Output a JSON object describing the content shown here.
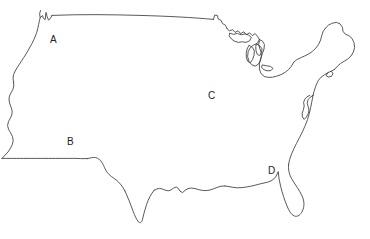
{
  "figure": {
    "kind": "map-outline",
    "width": 370,
    "height": 239,
    "background_color": "#ffffff",
    "outline_color": "#3b3b3b",
    "outline_width": 0.85,
    "label_color": "#1d1d1d",
    "label_font_size": 10
  },
  "labels": [
    {
      "id": "label-a",
      "text": "A",
      "x": 50,
      "y": 35,
      "region_hint": "Pacific Northwest"
    },
    {
      "id": "label-b",
      "text": "B",
      "x": 67,
      "y": 137,
      "region_hint": "Southwest"
    },
    {
      "id": "label-c",
      "text": "C",
      "x": 208,
      "y": 91,
      "region_hint": "Midwest"
    },
    {
      "id": "label-d",
      "text": "D",
      "x": 268,
      "y": 166,
      "region_hint": "Southeast Gulf"
    }
  ],
  "outline": {
    "description": "Contiguous United States coastline and national borders, single continuous stroke plus Great Lakes interior lines",
    "main_path": "M 41 11 L 40 18 L 43 16 L 45 19 L 46 12 L 48 20 L 51 18 L 54 16 L 62 15 L 75 14 L 92 14 L 112 15 L 134 16 L 158 17 L 176 18 L 192 19 L 205 20 L 214 21 L 216 16 L 219 17 L 221 22 L 224 26 L 227 31 L 230 33 L 233 31 L 236 34 L 240 32 L 243 35 L 246 33 L 249 36 L 252 34 L 255 37 L 258 40 L 256 44 L 252 46 L 249 50 L 247 55 L 249 59 L 252 57 L 254 52 L 257 48 L 259 44 L 262 41 L 264 44 L 262 49 L 259 54 L 256 60 L 254 66 L 252 73 L 251 80 L 253 86 L 257 89 L 261 88 L 264 85 L 266 81 L 269 78 L 272 76 L 276 75 L 280 74 L 284 73 L 288 71 L 292 69 L 295 66 L 297 62 L 300 59 L 304 57 L 308 55 L 312 53 L 316 50 L 319 46 L 322 42 L 324 37 L 326 32 L 328 27 L 331 24 L 334 22 L 337 21 L 340 23 L 342 27 L 345 30 L 348 32 L 351 35 L 353 39 L 355 44 L 356 50 L 354 55 L 351 59 L 348 62 L 345 65 L 343 69 L 341 73 L 338 76 L 334 78 L 331 81 L 328 84 L 325 87 L 322 90 L 319 93 L 317 97 L 315 101 L 313 105 L 311 109 L 310 113 L 309 117 L 308 121 L 306 125 L 304 129 L 302 133 L 300 137 L 298 141 L 296 145 L 294 149 L 292 153 L 290 157 L 288 161 L 287 165 L 287 169 L 288 173 L 290 177 L 293 181 L 296 185 L 299 189 L 301 193 L 303 197 L 304 201 L 304 205 L 303 209 L 301 213 L 298 216 L 295 218 L 292 217 L 289 214 L 287 210 L 285 206 L 283 202 L 281 198 L 280 194 L 279 190 L 278 186 L 277 182 L 276 178 L 274 181 L 271 183 L 268 184 L 264 185 L 260 186 L 256 187 L 252 188 L 248 189 L 244 190 L 240 191 L 236 192 L 232 192 L 228 192 L 224 191 L 220 191 L 216 190 L 212 190 L 208 191 L 204 192 L 200 193 L 196 194 L 192 195 L 188 196 L 184 197 L 180 198 L 176 198 L 172 197 L 168 196 L 164 195 L 160 196 L 157 199 L 155 203 L 153 207 L 151 211 L 149 215 L 147 219 L 144 221 L 141 219 L 139 215 L 137 211 L 135 207 L 133 203 L 131 199 L 129 195 L 127 191 L 125 187 L 123 183 L 121 180 L 118 178 L 115 177 L 112 176 L 109 175 L 106 174 L 103 173 L 100 172 L 97 172 L 94 172 L 91 172 L 88 172 L 85 172 L 82 172 L 79 172 L 76 172 L 73 172 L 70 172 L 67 172 L 64 172 L 61 172 L 58 172 L 55 172 L 52 172 L 49 172 L 46 172 L 43 172 L 40 172 L 37 172 L 34 172 L 31 172 L 28 172 L 25 172 L 22 172 L 19 172 L 16 172 L 13 172 L 10 172 L 8 170 L 7 166 L 8 162 L 9 158 L 10 154 L 11 150 L 11 146 L 10 142 L 9 138 L 9 134 L 10 130 L 11 126 L 12 122 L 12 118 L 11 114 L 10 110 L 10 106 L 11 102 L 12 98 L 13 94 L 14 90 L 14 86 L 13 82 L 13 78 L 14 74 L 16 70 L 18 66 L 20 62 L 22 58 L 24 54 L 26 50 L 28 46 L 30 42 L 32 38 L 34 34 L 36 30 L 37 26 L 38 22 L 39 18 Z",
    "great_lakes": [
      "M 232 33 L 236 35 L 240 34 L 244 36 L 248 35 L 252 37 L 250 41 L 246 43 L 242 42 L 238 43 L 234 41 L 231 38 Z",
      "M 249 44 L 253 46 L 256 49 L 254 54 L 251 58 L 248 56 L 246 52 L 247 47 Z",
      "M 255 62 L 259 64 L 262 67 L 260 71 L 256 72 L 253 69 L 253 65 Z"
    ]
  },
  "accessibility": {
    "alt_text": "Black and white outline map of the contiguous United States with four letters labeling regions: A in the northwest, B in the southwest, C in the midwest, and D in the southeast."
  }
}
